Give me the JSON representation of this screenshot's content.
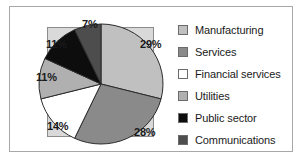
{
  "chart_data": {
    "type": "pie",
    "title": "",
    "categories": [
      "Manufacturing",
      "Services",
      "Financial services",
      "Utilities",
      "Public sector",
      "Communications"
    ],
    "values": [
      29,
      28,
      14,
      11,
      11,
      7
    ],
    "value_labels": [
      "29%",
      "28%",
      "14%",
      "11%",
      "11%",
      "7%"
    ],
    "colors": [
      "#c0c0c0",
      "#8a8a8a",
      "#ffffff",
      "#b0b0b0",
      "#0d0d0d",
      "#4d4d4d"
    ],
    "legend_position": "right",
    "grid": false,
    "start_angle_deg": 0,
    "direction": "clockwise"
  },
  "legend": {
    "items": [
      {
        "label": "Manufacturing",
        "swatch": "#c0c0c0"
      },
      {
        "label": "Services",
        "swatch": "#8a8a8a"
      },
      {
        "label": "Financial services",
        "swatch": "#ffffff"
      },
      {
        "label": "Utilities",
        "swatch": "#b0b0b0"
      },
      {
        "label": "Public sector",
        "swatch": "#0d0d0d"
      },
      {
        "label": "Communications",
        "swatch": "#4d4d4d"
      }
    ]
  }
}
